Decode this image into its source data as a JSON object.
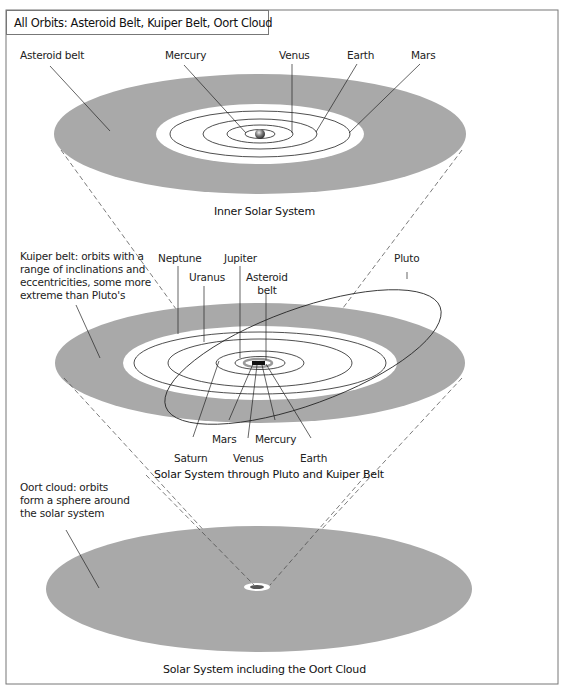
{
  "title": "All Orbits: Asteroid Belt, Kuiper Belt, Oort Cloud",
  "colors": {
    "belt_gray": "#a9a9a9",
    "line": "#222222",
    "frame": "#777777"
  },
  "panels": [
    {
      "caption": "Inner Solar System",
      "labels": {
        "asteroid_belt": "Asteroid belt",
        "mercury": "Mercury",
        "venus": "Venus",
        "earth": "Earth",
        "mars": "Mars"
      }
    },
    {
      "caption": "Solar System through Pluto and Kuiper Belt",
      "labels": {
        "kuiper_note": "Kuiper belt: orbits with a\nrange of inclinations and\neccentricities, some more\nextreme than Pluto's",
        "neptune": "Neptune",
        "jupiter": "Jupiter",
        "uranus": "Uranus",
        "asteroid_belt": "Asteroid\nbelt",
        "pluto": "Pluto",
        "saturn": "Saturn",
        "mars": "Mars",
        "venus": "Venus",
        "mercury": "Mercury",
        "earth": "Earth"
      }
    },
    {
      "caption": "Solar System including the Oort Cloud",
      "labels": {
        "oort_note": "Oort cloud: orbits\nform a sphere around\nthe solar system"
      }
    }
  ]
}
